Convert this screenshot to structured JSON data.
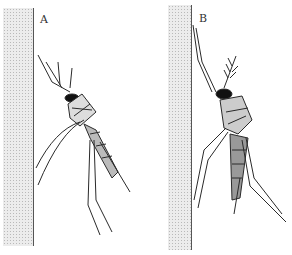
{
  "figure": {
    "type": "scientific illustration",
    "panels": [
      {
        "label": "A",
        "description": "mosquito resting with body angled, legs trailing downward"
      },
      {
        "label": "B",
        "description": "mosquito resting with body held closer to the wall, legs extended down-right"
      }
    ],
    "colors": {
      "ink": "#222222",
      "wall": "#ececec",
      "background": "#ffffff"
    }
  }
}
